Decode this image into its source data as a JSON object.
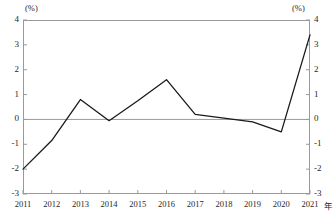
{
  "chart_data": {
    "type": "line",
    "title": "",
    "subtitle": "",
    "xlabel": "",
    "ylabel": "",
    "unit_label_left": "(%)",
    "unit_label_right": "(%)",
    "x_axis_suffix": "年",
    "categories": [
      "2011",
      "2012",
      "2013",
      "2014",
      "2015",
      "2016",
      "2017",
      "2018",
      "2019",
      "2020",
      "2021"
    ],
    "values": [
      -2.0,
      -0.85,
      0.8,
      -0.05,
      0.75,
      1.6,
      0.2,
      0.05,
      -0.1,
      -0.5,
      3.4
    ],
    "series": [
      {
        "name": "",
        "values": [
          -2.0,
          -0.85,
          0.8,
          -0.05,
          0.75,
          1.6,
          0.2,
          0.05,
          -0.1,
          -0.5,
          3.4
        ],
        "color": "#1a1a1a"
      }
    ],
    "ylim": [
      -3,
      4
    ],
    "y_ticks": [
      "4",
      "3",
      "2",
      "1",
      "0",
      "-1",
      "-2",
      "-3"
    ],
    "y_tick_values": [
      4,
      3,
      2,
      1,
      0,
      -1,
      -2,
      -3
    ],
    "x_ticks": [
      "2011",
      "2012",
      "2013",
      "2014",
      "2015",
      "2016",
      "2017",
      "2018",
      "2019",
      "2020",
      "2021"
    ],
    "grid": false,
    "zero_line": true,
    "zero_line_color": "#9a9a9a",
    "frame_color": "#9a9a9a",
    "legend": [],
    "legend_position": "none",
    "annotations": []
  }
}
